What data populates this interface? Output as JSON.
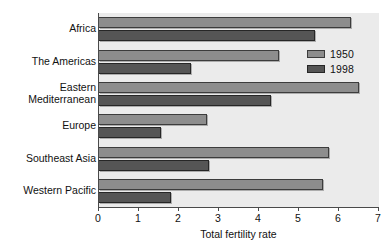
{
  "chart_data": {
    "type": "bar",
    "orientation": "horizontal",
    "title": "",
    "xlabel": "Total fertility rate",
    "ylabel": "",
    "xlim": [
      0,
      7
    ],
    "xticks": [
      "0",
      "1",
      "2",
      "3",
      "4",
      "5",
      "6",
      "7"
    ],
    "grid": false,
    "legend_position": "upper-right-inside",
    "categories": [
      "Africa",
      "The Americas",
      "Eastern Mediterranean",
      "Europe",
      "Southeast Asia",
      "Western Pacific"
    ],
    "category_label_lines": [
      [
        "Africa"
      ],
      [
        "The Americas"
      ],
      [
        "Eastern",
        "Mediterranean"
      ],
      [
        "Europe"
      ],
      [
        "Southeast Asia"
      ],
      [
        "Western Pacific"
      ]
    ],
    "series": [
      {
        "name": "1950",
        "color": "#8d8d8d",
        "values": [
          6.3,
          4.5,
          6.5,
          2.7,
          5.75,
          5.6
        ]
      },
      {
        "name": "1998",
        "color": "#555555",
        "values": [
          5.4,
          2.3,
          4.3,
          1.55,
          2.75,
          1.8
        ]
      }
    ]
  },
  "legend": {
    "items": [
      {
        "label": "1950"
      },
      {
        "label": "1998"
      }
    ]
  },
  "colors": {
    "plot_background": "#ebebeb",
    "axis": "#4a4a4a",
    "bar_1950": "#8d8d8d",
    "bar_1998": "#555555",
    "text": "#111111"
  }
}
